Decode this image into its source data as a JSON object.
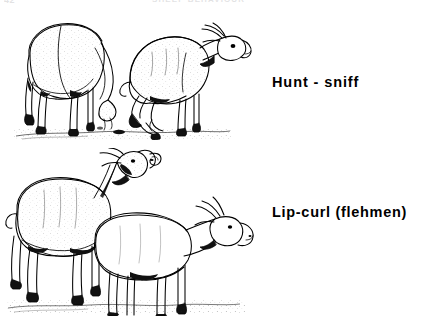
{
  "page": {
    "folio": "42",
    "running_title": "SHEEP BEHAVIOUR",
    "background_color": "#ffffff",
    "ink_color": "#000000"
  },
  "figure": {
    "rows": [
      {
        "id": "hunt-sniff",
        "caption": "Hunt - sniff",
        "illustration_name": "ram-hunt-sniff-drawing",
        "animals": [
          {
            "role": "ewe",
            "posture": "grazing, head lowered to ground, viewed from rear three-quarter left"
          },
          {
            "role": "ram",
            "posture": "crouched low on hind legs, neck extended forward, nose toward ewe's hindquarters"
          }
        ]
      },
      {
        "id": "lip-curl",
        "caption": "Lip-curl (flehmen)",
        "illustration_name": "ram-lip-curl-flehmen-drawing",
        "animals": [
          {
            "role": "ram",
            "posture": "standing, head raised high with upper lip curled back (flehmen response)"
          },
          {
            "role": "ewe",
            "posture": "standing in front, head level, facing right"
          }
        ]
      }
    ]
  }
}
